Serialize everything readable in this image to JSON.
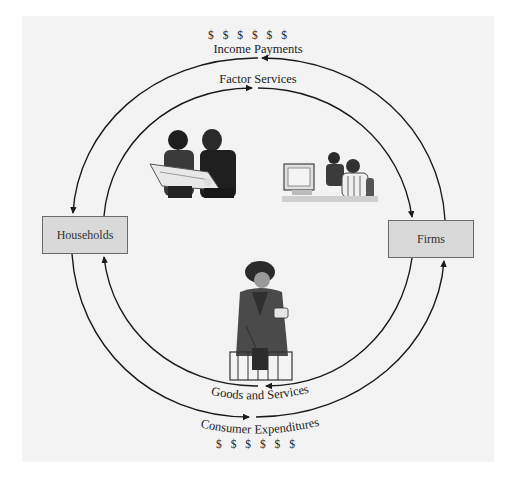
{
  "diagram": {
    "type": "circular-flow",
    "nodes": {
      "left": "Households",
      "right": "Firms"
    },
    "flows": {
      "top_outer": {
        "label": "Income Payments",
        "symbol_row": "$ $ $ $ $ $",
        "direction": "Firms → Households"
      },
      "top_inner": {
        "label": "Factor Services",
        "direction": "Households → Firms"
      },
      "bottom_inner": {
        "label": "Goods and Services",
        "direction": "Firms → Households"
      },
      "bottom_outer": {
        "label": "Consumer Expenditures",
        "symbol_row": "$ $ $ $ $ $",
        "direction": "Households → Firms"
      }
    },
    "illustrations": {
      "top_left": "workers-reviewing-plans-icon",
      "top_right": "office-workers-at-computer-icon",
      "center_bottom": "shopper-with-basket-icon"
    },
    "colors": {
      "panel_bg": "#f3f3f3",
      "box_fill": "#d9d9d9",
      "box_border": "#6a6a6a",
      "arrow": "#1a1a1a"
    }
  }
}
